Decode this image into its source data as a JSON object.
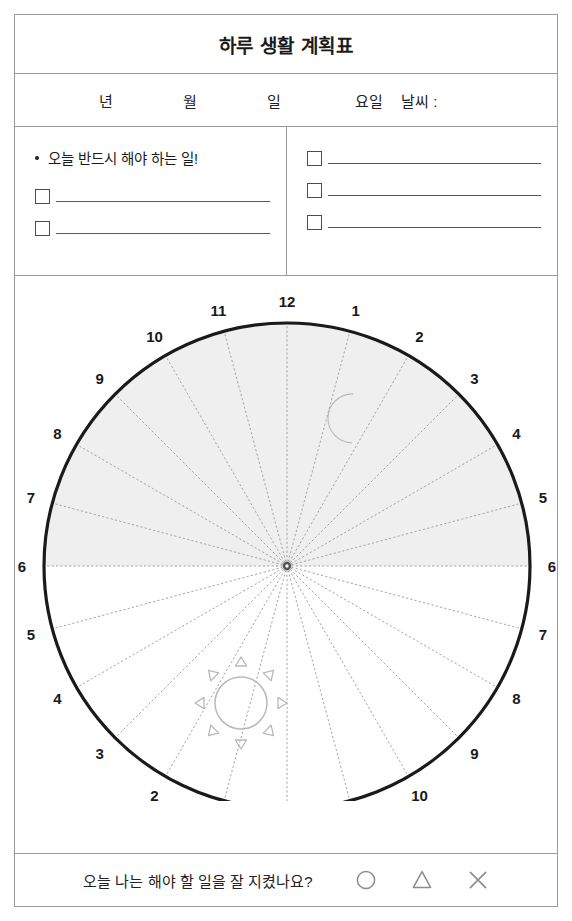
{
  "header": {
    "title": "하루 생활 계획표"
  },
  "date_row": {
    "year_label": "년",
    "month_label": "월",
    "day_label": "일",
    "weekday_label": "요일",
    "weather_label": "날씨 :"
  },
  "todo": {
    "left": {
      "heading": "오늘 반드시 해야 하는 일!",
      "items": [
        {
          "checkbox": "unchecked",
          "text": ""
        },
        {
          "checkbox": "unchecked",
          "text": ""
        }
      ]
    },
    "right": {
      "items": [
        {
          "checkbox": "unchecked",
          "text": ""
        },
        {
          "checkbox": "unchecked",
          "text": ""
        },
        {
          "checkbox": "unchecked",
          "text": ""
        }
      ]
    }
  },
  "clock": {
    "type": "24-hour-radial-planner",
    "center": {
      "x": 286,
      "y": 563
    },
    "radius": 243,
    "sectors": 24,
    "night_half_shaded": true,
    "shade_color": "#efefef",
    "rim_color": "#1a1a1a",
    "spoke_color": "#9a9a9a",
    "hub_color": "#555555",
    "outer_labels_top": [
      "12",
      "1",
      "2",
      "3",
      "4",
      "5",
      "6"
    ],
    "outer_labels_bottom": [
      "6",
      "7",
      "8",
      "9",
      "10",
      "11",
      "12"
    ],
    "outer_labels_left_top": [
      "11",
      "10",
      "9",
      "8",
      "7",
      "6"
    ],
    "outer_labels_left_bottom": [
      "5",
      "4",
      "3",
      "2",
      "1"
    ],
    "all_labels_clockwise_from_top": [
      "12",
      "1",
      "2",
      "3",
      "4",
      "5",
      "6",
      "7",
      "8",
      "9",
      "10",
      "11",
      "12",
      "1",
      "2",
      "3",
      "4",
      "5",
      "6",
      "7",
      "8",
      "9",
      "10",
      "11"
    ],
    "moon_icon": "crescent-moon",
    "sun_icon": "sun",
    "icon_color": "#b9b9b9"
  },
  "footer": {
    "question": "오늘 나는 해야 할 일을 잘 지켰나요?",
    "marks": [
      "circle",
      "triangle",
      "cross"
    ],
    "mark_color": "#8c8c8c"
  }
}
